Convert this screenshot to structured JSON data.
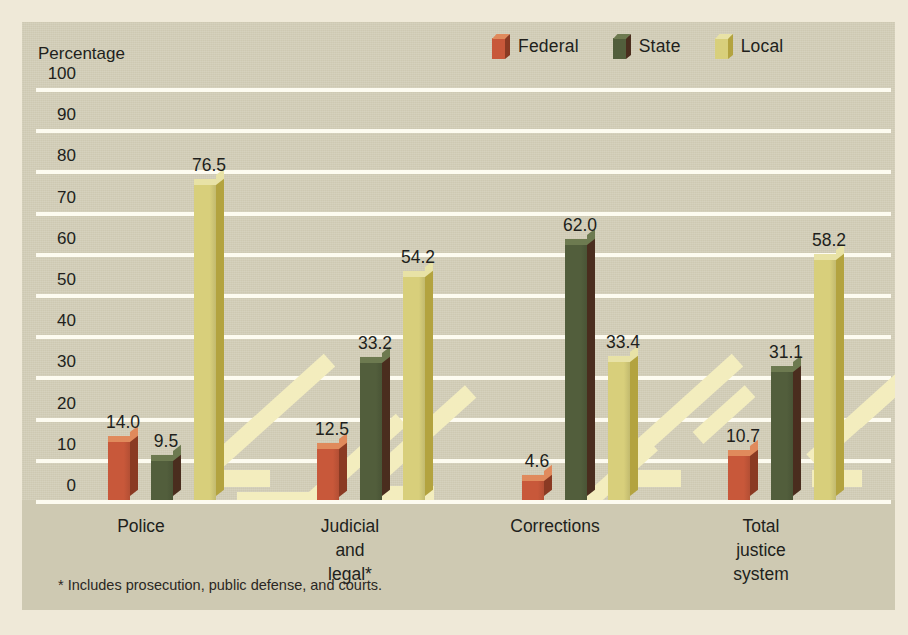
{
  "figure": {
    "background_color": "#efe9d8",
    "panel_color": "#cec9b2",
    "gridline_color": "#fdfbf0"
  },
  "legend": {
    "position": "top-right",
    "items": [
      {
        "label": "Federal",
        "color": "#c8583a",
        "side_color": "#8a3a23",
        "top_color": "#e08a5c",
        "icon": "legend-cube-icon"
      },
      {
        "label": "State",
        "color": "#525e3c",
        "side_color": "#4a2d1e",
        "top_color": "#6d7a50",
        "icon": "legend-cube-icon"
      },
      {
        "label": "Local",
        "color": "#d8cf7b",
        "side_color": "#b3a33f",
        "top_color": "#e8e2a6",
        "icon": "legend-cube-icon"
      }
    ]
  },
  "axis": {
    "y_title": "Percentage",
    "y_ticks": [
      "100",
      "90",
      "80",
      "70",
      "60",
      "50",
      "40",
      "30",
      "20",
      "10",
      "0"
    ]
  },
  "footnote": "* Includes prosecution, public defense, and courts.",
  "categories": [
    {
      "label": "Police"
    },
    {
      "label": "Judicial\nand\nlegal*"
    },
    {
      "label": "Corrections"
    },
    {
      "label": "Total\njustice\nsystem"
    }
  ],
  "bars": [
    {
      "group": 0,
      "series": 0,
      "value": "14.0"
    },
    {
      "group": 0,
      "series": 1,
      "value": "9.5"
    },
    {
      "group": 0,
      "series": 2,
      "value": "76.5"
    },
    {
      "group": 1,
      "series": 0,
      "value": "12.5"
    },
    {
      "group": 1,
      "series": 1,
      "value": "33.2"
    },
    {
      "group": 1,
      "series": 2,
      "value": "54.2"
    },
    {
      "group": 2,
      "series": 0,
      "value": "4.6"
    },
    {
      "group": 2,
      "series": 1,
      "value": "62.0"
    },
    {
      "group": 2,
      "series": 2,
      "value": "33.4"
    },
    {
      "group": 3,
      "series": 0,
      "value": "10.7"
    },
    {
      "group": 3,
      "series": 1,
      "value": "31.1"
    },
    {
      "group": 3,
      "series": 2,
      "value": "58.2"
    }
  ],
  "chart_data": {
    "type": "bar",
    "title": "",
    "subtitle": "",
    "xlabel": "",
    "ylabel": "Percentage",
    "ylim": [
      0,
      100
    ],
    "ytick_step": 10,
    "yticks": [
      0,
      10,
      20,
      30,
      40,
      50,
      60,
      70,
      80,
      90,
      100
    ],
    "grid": true,
    "grid_axis": "y",
    "legend_position": "top-right",
    "data_labels": true,
    "style": "3d-column",
    "categories": [
      "Police",
      "Judicial and legal*",
      "Corrections",
      "Total justice system"
    ],
    "series": [
      {
        "name": "Federal",
        "color": "#c8583a",
        "values": [
          14.0,
          12.5,
          4.6,
          10.7
        ]
      },
      {
        "name": "State",
        "color": "#525e3c",
        "values": [
          9.5,
          33.2,
          62.0,
          31.1
        ]
      },
      {
        "name": "Local",
        "color": "#d8cf7b",
        "values": [
          76.5,
          54.2,
          33.4,
          58.2
        ]
      }
    ],
    "annotations": [
      "* Includes prosecution, public defense, and courts."
    ]
  }
}
